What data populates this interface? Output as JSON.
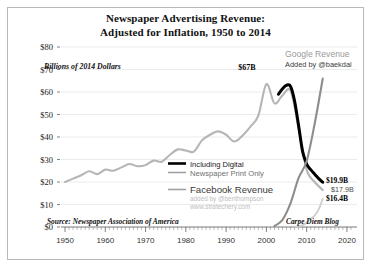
{
  "chart_data": {
    "type": "line",
    "title": "Newspaper Advertising Revenue:",
    "subtitle": "Adjusted for Inflation, 1950 to 2014",
    "ylabel": "Billions of 2014 Dollars",
    "xlabel": "",
    "ylim": [
      0,
      80
    ],
    "xlim": [
      1950,
      2022
    ],
    "ytick_labels": [
      "$0",
      "$10",
      "$20",
      "$30",
      "$40",
      "$50",
      "$60",
      "$70",
      "$80"
    ],
    "ytick_values": [
      0,
      10,
      20,
      30,
      40,
      50,
      60,
      70,
      80
    ],
    "xtick_labels": [
      "1950",
      "1960",
      "1970",
      "1980",
      "1990",
      "2000",
      "2010",
      "2020"
    ],
    "xtick_values": [
      1950,
      1960,
      1970,
      1980,
      1990,
      2000,
      2010,
      2020
    ],
    "grid": true,
    "legend_position": "center-right",
    "series": [
      {
        "name": "Newspaper Print Only",
        "color": "#b5b5b5",
        "x": [
          1950,
          1952,
          1954,
          1956,
          1958,
          1960,
          1962,
          1964,
          1966,
          1968,
          1970,
          1972,
          1974,
          1976,
          1978,
          1980,
          1982,
          1984,
          1986,
          1988,
          1990,
          1992,
          1994,
          1996,
          1998,
          2000,
          2002,
          2004,
          2006,
          2008,
          2010,
          2012,
          2014
        ],
        "y": [
          20.0,
          21.5,
          23.0,
          24.8,
          23.5,
          25.5,
          25.0,
          26.5,
          28.0,
          27.0,
          27.5,
          29.5,
          29.0,
          32.0,
          34.5,
          34.0,
          33.5,
          38.5,
          41.0,
          42.5,
          41.0,
          38.0,
          40.5,
          44.5,
          49.5,
          63.5,
          55.0,
          58.5,
          60.5,
          44.0,
          25.5,
          20.0,
          16.4
        ]
      },
      {
        "name": "Including Digital",
        "color": "#000000",
        "x": [
          2003,
          2004,
          2005,
          2006,
          2007,
          2008,
          2009,
          2010,
          2011,
          2012,
          2013,
          2014
        ],
        "y": [
          59.0,
          61.5,
          63.0,
          62.5,
          56.0,
          45.0,
          33.5,
          28.0,
          25.5,
          23.5,
          21.5,
          19.9
        ]
      },
      {
        "name": "Facebook Revenue",
        "color": "#cccccc",
        "x": [
          2007,
          2008,
          2009,
          2010,
          2011,
          2012,
          2013,
          2014
        ],
        "y": [
          0.15,
          0.27,
          0.78,
          2.0,
          3.7,
          5.1,
          7.9,
          12.5
        ]
      },
      {
        "name": "Google Revenue",
        "color": "#8d8d8d",
        "x": [
          2002,
          2004,
          2006,
          2008,
          2010,
          2012,
          2014
        ],
        "y": [
          0.4,
          3.2,
          10.6,
          21.8,
          29.3,
          46.0,
          66.0
        ]
      }
    ],
    "annotations": [
      {
        "name": "peak-label",
        "text": "$67B",
        "x": 2000,
        "y": 67
      },
      {
        "name": "google-revenue-label",
        "text": "Google Revenue",
        "x": 2013,
        "y": 74
      },
      {
        "name": "google-attribution-label",
        "text": "Added by @baekdal",
        "x": 2013,
        "y": 70
      },
      {
        "name": "value-including-digital",
        "text": "$19.9B",
        "x": 2015,
        "y": 19.9
      },
      {
        "name": "value-facebook",
        "text": "$17.9B",
        "x": 2015,
        "y": 17.9
      },
      {
        "name": "value-print-only",
        "text": "$16.4B",
        "x": 2015,
        "y": 16.4
      },
      {
        "name": "source-label",
        "text": "Source: Newspaper Association of America",
        "x": 1951,
        "y": 2
      },
      {
        "name": "carpe-diem-label",
        "text": "Carpe Diem Blog",
        "x": 2014,
        "y": 2
      }
    ],
    "legend": [
      {
        "label": "Including Digital",
        "color": "#000000",
        "weight": "bold"
      },
      {
        "label": "Newspaper Print Only",
        "color": "#9c9c9c",
        "weight": "normal"
      },
      {
        "label": "Facebook Revenue",
        "color": "#a5a5a5",
        "weight": "normal"
      }
    ],
    "legend_credits": [
      "added by @benthompson",
      "www.stratechery.com"
    ]
  },
  "colors": {
    "border": "#b8b8b8",
    "grid": "#e2e2e2",
    "background": "#ffffff",
    "print_only": "#b5b5b5",
    "including_digital": "#000000",
    "facebook": "#cccccc",
    "google": "#8d8d8d"
  }
}
